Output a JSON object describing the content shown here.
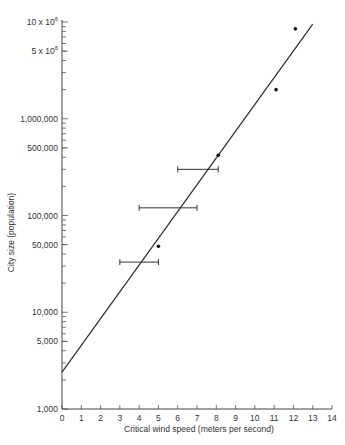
{
  "chart_data": {
    "type": "scatter",
    "title": "",
    "xlabel": "Critical wind speed (meters per second)",
    "ylabel": "City size (population)",
    "xlim": [
      0,
      14
    ],
    "ylim": [
      1000,
      10000000
    ],
    "yscale": "log",
    "grid": false,
    "x_ticks": [
      0,
      1,
      2,
      3,
      4,
      5,
      6,
      7,
      8,
      9,
      10,
      11,
      12,
      13,
      14
    ],
    "x_tick_labels": [
      "0",
      "1",
      "2",
      "3",
      "4",
      "5",
      "6",
      "7",
      "8",
      "9",
      "10",
      "11",
      "12",
      "13",
      "14"
    ],
    "y_ticks": [
      {
        "value": 1000,
        "label": "1,000"
      },
      {
        "value": 5000,
        "label": "5,000"
      },
      {
        "value": 10000,
        "label": "10,000"
      },
      {
        "value": 50000,
        "label": "50,000"
      },
      {
        "value": 100000,
        "label": "100,000"
      },
      {
        "value": 500000,
        "label": "500,000"
      },
      {
        "value": 1000000,
        "label": "1,000,000"
      },
      {
        "value": 5000000,
        "label": "5 x 10",
        "sup": "6"
      },
      {
        "value": 10000000,
        "label": "10 x 10",
        "sup": "6"
      }
    ],
    "points": [
      {
        "x": 5.0,
        "y": 48000
      },
      {
        "x": 8.1,
        "y": 420000
      },
      {
        "x": 11.1,
        "y": 2000000
      },
      {
        "x": 12.1,
        "y": 8500000
      }
    ],
    "error_bars": [
      {
        "y": 33000,
        "x_low": 3.0,
        "x_high": 5.0
      },
      {
        "y": 120000,
        "x_low": 4.0,
        "x_high": 7.0
      },
      {
        "y": 300000,
        "x_low": 6.0,
        "x_high": 8.1
      }
    ],
    "fit_line": {
      "x_start": 0,
      "y_start": 2400,
      "x_end": 13.0,
      "y_end": 9500000
    }
  }
}
